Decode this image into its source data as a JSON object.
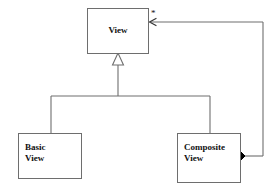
{
  "diagram": {
    "notation": "UML class diagram",
    "background_color": "#ffffff",
    "line_color": "#6e6e6e",
    "fill_color": "#ffffff",
    "text_color": "#111111",
    "diamond_color": "#000000"
  },
  "classes": [
    {
      "id": "view",
      "name": "View",
      "name_display": "View",
      "align": "center",
      "x": 87,
      "y": 8,
      "width": 62,
      "height": 46
    },
    {
      "id": "basic-view",
      "name": "Basic View",
      "name_display": "Basic\nView",
      "align": "left",
      "x": 18,
      "y": 133,
      "width": 64,
      "height": 46
    },
    {
      "id": "composite-view",
      "name": "Composite View",
      "name_display": "Composite\nView",
      "align": "left",
      "x": 177,
      "y": 133,
      "width": 64,
      "height": 50
    }
  ],
  "relationships": [
    {
      "id": "generalization-basic",
      "type": "generalization",
      "source": "Basic View",
      "target": "View",
      "arrow": "hollow-triangle"
    },
    {
      "id": "generalization-composite",
      "type": "generalization",
      "source": "Composite View",
      "target": "View",
      "arrow": "hollow-triangle"
    },
    {
      "id": "composition-children",
      "type": "composition",
      "source": "Composite View",
      "target": "View",
      "arrow": "open-arrow",
      "source_decoration": "filled-diamond",
      "target_multiplicity": "*"
    }
  ],
  "labels": {
    "multiplicity_star": "*"
  }
}
